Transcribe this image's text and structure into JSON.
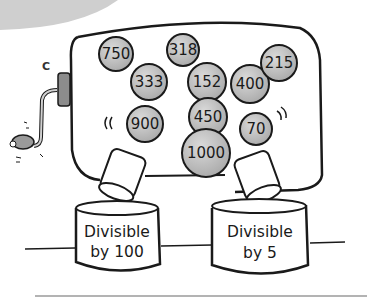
{
  "figure": {
    "label": "C"
  },
  "balls": [
    {
      "value": "750",
      "cx": 116,
      "cy": 54,
      "r": 17
    },
    {
      "value": "318",
      "cx": 183,
      "cy": 50,
      "r": 16
    },
    {
      "value": "333",
      "cx": 149,
      "cy": 82,
      "r": 18
    },
    {
      "value": "152",
      "cx": 207,
      "cy": 82,
      "r": 19
    },
    {
      "value": "400",
      "cx": 250,
      "cy": 84,
      "r": 19
    },
    {
      "value": "215",
      "cx": 279,
      "cy": 63,
      "r": 18
    },
    {
      "value": "900",
      "cx": 145,
      "cy": 124,
      "r": 18
    },
    {
      "value": "450",
      "cx": 208,
      "cy": 117,
      "r": 19
    },
    {
      "value": "70",
      "cx": 256,
      "cy": 129,
      "r": 16
    },
    {
      "value": "1000",
      "cx": 206,
      "cy": 153,
      "r": 24
    }
  ],
  "bins": [
    {
      "line1": "Divisible",
      "line2": "by 100"
    },
    {
      "line1": "Divisible",
      "line2": "by 5"
    }
  ],
  "colors": {
    "ball_fill": "#b8b8b8",
    "ball_highlight": "#d9d9d9",
    "outline": "#1a1a1a",
    "top_arc": "#c9c9c9",
    "rule": "#9a9a9a"
  }
}
